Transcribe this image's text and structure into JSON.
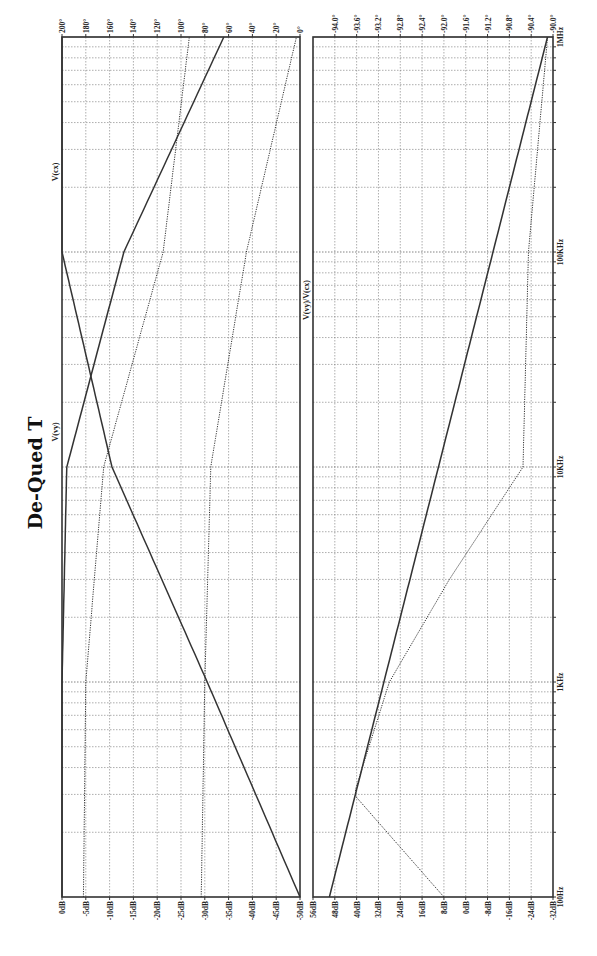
{
  "chart_data": [
    {
      "type": "line",
      "title": "De-Qued T",
      "panel": "left",
      "orientation": "rotated-90",
      "x_axis": {
        "label": "Frequency",
        "scale": "log",
        "range": [
          "100Hz",
          "1MHz"
        ],
        "ticks": [
          "100Hz",
          "1KHz",
          "10KHz",
          "100KHz",
          "1MHz"
        ]
      },
      "y_axis_magnitude": {
        "unit": "dB",
        "range": [
          0,
          -50
        ],
        "ticks": [
          "0dB",
          "-5dB",
          "-10dB",
          "-15dB",
          "-20dB",
          "-25dB",
          "-30dB",
          "-35dB",
          "-40dB",
          "-45dB",
          "-50dB"
        ]
      },
      "y_axis_phase": {
        "unit": "deg",
        "range": [
          200,
          0
        ],
        "ticks": [
          "200°",
          "180°",
          "160°",
          "140°",
          "120°",
          "100°",
          "80°",
          "60°",
          "40°",
          "20°",
          "0°"
        ]
      },
      "grid": true,
      "series": [
        {
          "name": "V(vy)",
          "kind": "magnitude",
          "style": "solid",
          "x": [
            100,
            1000,
            10000,
            100000,
            1000000
          ],
          "values": [
            -50,
            -30.5,
            -10.5,
            0,
            0
          ]
        },
        {
          "name": "V(cx)",
          "kind": "magnitude",
          "style": "solid",
          "x": [
            100,
            1000,
            10000,
            100000,
            1000000
          ],
          "values": [
            0,
            0,
            -1,
            -13,
            -34
          ]
        },
        {
          "name": "V(vy) phase",
          "kind": "phase",
          "style": "dotted",
          "x": [
            100,
            1000,
            10000,
            100000,
            1000000
          ],
          "values": [
            83,
            80,
            75,
            45,
            3
          ]
        },
        {
          "name": "V(cx) phase",
          "kind": "phase",
          "style": "dotted",
          "x": [
            100,
            1000,
            10000,
            100000,
            1000000
          ],
          "values": [
            182,
            180,
            165,
            115,
            93
          ]
        }
      ],
      "annotations": [
        "V(vy)",
        "V(cx)"
      ]
    },
    {
      "type": "line",
      "panel": "right",
      "orientation": "rotated-90",
      "x_axis": {
        "label": "Frequency",
        "scale": "log",
        "range": [
          "100Hz",
          "1MHz"
        ],
        "ticks": [
          "100Hz",
          "1KHz",
          "10KHz",
          "100KHz",
          "1MHz"
        ]
      },
      "y_axis_magnitude": {
        "unit": "dB",
        "range": [
          56,
          -32
        ],
        "ticks": [
          "56dB",
          "48dB",
          "40dB",
          "32dB",
          "24dB",
          "16dB",
          "8dB",
          "0dB",
          "-8dB",
          "-16dB",
          "-24dB",
          "-32dB"
        ]
      },
      "y_axis_phase": {
        "unit": "deg",
        "range": [
          -94.0,
          -90.0
        ],
        "ticks": [
          "-94.0°",
          "-93.6°",
          "-93.2°",
          "-92.8°",
          "-92.4°",
          "-92.0°",
          "-91.6°",
          "-91.2°",
          "-90.8°",
          "-90.4°",
          "-90.0°"
        ]
      },
      "grid": true,
      "series": [
        {
          "name": "V(vy)/V(cx)",
          "kind": "magnitude",
          "style": "solid",
          "x": [
            100,
            1000,
            10000,
            100000,
            1000000
          ],
          "values": [
            50,
            30,
            10,
            -10,
            -30
          ]
        },
        {
          "name": "V(vy)/V(cx) phase",
          "kind": "phase",
          "style": "dotted",
          "x": [
            100,
            300,
            1000,
            3000,
            10000,
            100000,
            1000000
          ],
          "values": [
            -92.0,
            -93.65,
            -93.0,
            -91.9,
            -90.55,
            -90.45,
            -90.1
          ]
        }
      ],
      "annotations": [
        "V(vy)/V(cx)"
      ]
    }
  ],
  "title": "De-Qued T",
  "labels": {
    "left_top": [
      "200°",
      "180°",
      "160°",
      "140°",
      "120°",
      "100°",
      "80°",
      "60°",
      "40°",
      "20°",
      "0°"
    ],
    "left_bottom": [
      "0dB",
      "-5dB",
      "-10dB",
      "-15dB",
      "-20dB",
      "-25dB",
      "-30dB",
      "-35dB",
      "-40dB",
      "-45dB",
      "-50dB"
    ],
    "right_top": [
      "-94.0°",
      "-93.6°",
      "-93.2°",
      "-92.8°",
      "-92.4°",
      "-92.0°",
      "-91.6°",
      "-91.2°",
      "-90.8°",
      "-90.4°",
      "-90.0°"
    ],
    "right_bottom": [
      "56dB",
      "48dB",
      "40dB",
      "32dB",
      "24dB",
      "16dB",
      "8dB",
      "0dB",
      "-8dB",
      "-16dB",
      "-24dB",
      "-32dB"
    ],
    "freq": [
      "1MHz",
      "100KHz",
      "10KHz",
      "1KHz",
      "100Hz"
    ],
    "trace_vcx": "V(cx)",
    "trace_vvy": "V(vy)",
    "trace_ratio": "V(vy)/V(cx)"
  }
}
